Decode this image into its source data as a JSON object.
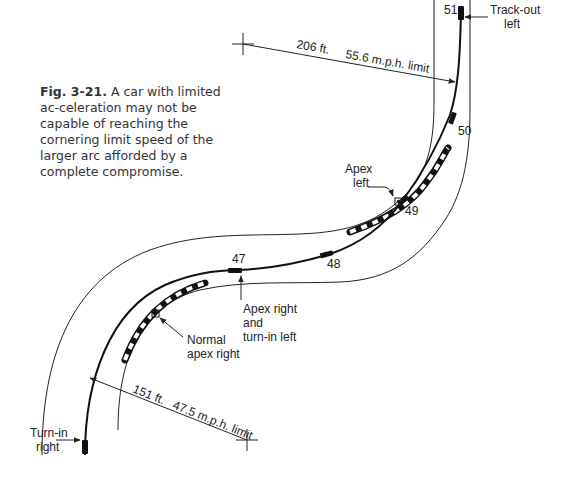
{
  "caption": {
    "figure_number": "Fig. 3-21.",
    "text": " A car with limited ac-celeration may not be capable of reaching the cornering limit speed of the larger arc afforded by a complete compromise."
  },
  "dimensions": {
    "upper": {
      "distance": "206 ft.",
      "speed": "55.6 m.p.h. limit"
    },
    "lower": {
      "distance": "151 ft.",
      "speed": "47.5 m.p.h. limit"
    }
  },
  "car_positions": [
    {
      "label": "47"
    },
    {
      "label": "48"
    },
    {
      "label": "49"
    },
    {
      "label": "50"
    },
    {
      "label": "51"
    }
  ],
  "annotations": {
    "turn_in_right": [
      "Turn-in",
      "right"
    ],
    "normal_apex_right": [
      "Normal",
      "apex right"
    ],
    "apex_right_turn_in_left": [
      "Apex right",
      "and",
      "turn-in left"
    ],
    "apex_left": [
      "Apex",
      "left"
    ],
    "track_out_left": [
      "Track-out",
      "left"
    ]
  },
  "colors": {
    "line": "#222222",
    "curb_dark": "#111111",
    "curb_light": "#ffffff",
    "background": "#ffffff"
  }
}
